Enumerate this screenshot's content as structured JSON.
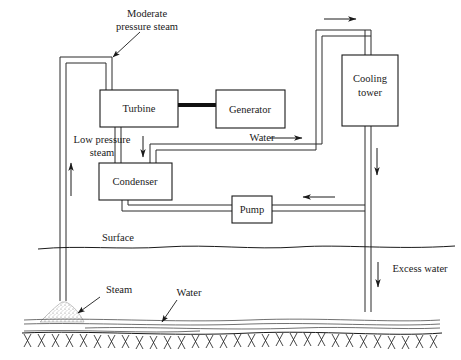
{
  "diagram": {
    "background_color": "#ffffff",
    "line_color": "#1a1a1a",
    "components": {
      "turbine": "Turbine",
      "generator": "Generator",
      "condenser": "Condenser",
      "pump": "Pump",
      "cooling_tower_line1": "Cooling",
      "cooling_tower_line2": "tower"
    },
    "annotations": {
      "moderate_steam_line1": "Moderate",
      "moderate_steam_line2": "pressure steam",
      "low_pressure_line1": "Low pressure",
      "low_pressure_line2": "steam",
      "water_flow": "Water",
      "surface": "Surface",
      "excess_water": "Excess water",
      "steam_ground": "Steam",
      "water_ground": "Water"
    },
    "flow_arrows": [
      {
        "name": "production-well-up",
        "direction": "up"
      },
      {
        "name": "turbine-to-condenser-down",
        "direction": "down"
      },
      {
        "name": "cooling-water-to-tower-right",
        "direction": "right"
      },
      {
        "name": "tower-top-inlet-right",
        "direction": "right"
      },
      {
        "name": "tower-downcomer-down",
        "direction": "down"
      },
      {
        "name": "pump-suction-left",
        "direction": "left"
      },
      {
        "name": "excess-water-down",
        "direction": "down"
      }
    ]
  }
}
